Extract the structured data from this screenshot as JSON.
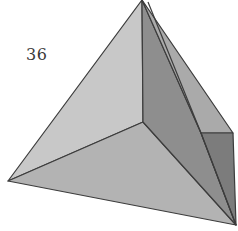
{
  "figure": {
    "label": "36",
    "colors": {
      "background": "#ffffff",
      "left_face": "#c6c6c6",
      "front_face": "#b4b4b4",
      "right_face": "#8c8c8c",
      "right_outer_face": "#a9a9a9",
      "notch_inner_face": "#7d7d7d",
      "notch_top_face": "#b7b7b7",
      "edge": "#3c3c3c",
      "label_text": "#3a3a3a"
    }
  }
}
